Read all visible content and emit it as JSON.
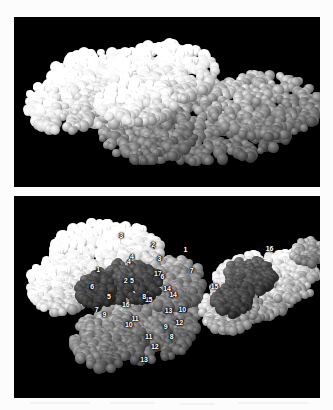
{
  "figure": {
    "background_color": "#fcfcfc",
    "panel_background": "#000000",
    "label_color": "#ffffff",
    "panels": [
      {
        "id": "top",
        "name": "dimer-overview",
        "description": "Side view of the assembled dimer, white subunit at upper left and gray subunit at lower right",
        "labels": []
      },
      {
        "id": "bottom",
        "name": "monomer-pair",
        "description": "Two separated subunit views with numbered contact residues",
        "labels": []
      }
    ]
  },
  "left_molecule": {
    "name": "left-subunit",
    "shading": "light",
    "label_count": 17,
    "labels": [
      {
        "text": "1",
        "x": 27.5,
        "y": 36.0
      },
      {
        "text": "2",
        "x": 36.5,
        "y": 41.5
      },
      {
        "text": "3",
        "x": 47.5,
        "y": 30.5
      },
      {
        "text": "4",
        "x": 38.5,
        "y": 29.5
      },
      {
        "text": "5",
        "x": 31.0,
        "y": 49.5
      },
      {
        "text": "6",
        "x": 25.5,
        "y": 44.5
      },
      {
        "text": "7",
        "x": 27.0,
        "y": 56.0
      },
      {
        "text": "8",
        "x": 51.5,
        "y": 69.5
      },
      {
        "text": "9",
        "x": 49.5,
        "y": 64.5
      },
      {
        "text": "10",
        "x": 55.0,
        "y": 56.0
      },
      {
        "text": "11",
        "x": 39.5,
        "y": 60.5
      },
      {
        "text": "12",
        "x": 46.0,
        "y": 74.0
      },
      {
        "text": "13",
        "x": 42.5,
        "y": 80.5
      },
      {
        "text": "14",
        "x": 50.0,
        "y": 45.5
      },
      {
        "text": "15",
        "x": 44.0,
        "y": 51.0
      },
      {
        "text": "16",
        "x": 36.5,
        "y": 53.5
      },
      {
        "text": "17",
        "x": 47.0,
        "y": 38.0
      }
    ]
  },
  "right_molecule": {
    "name": "right-subunit",
    "shading": "light",
    "label_count": 16,
    "labels": [
      {
        "text": "1",
        "x": 56.0,
        "y": 26.0
      },
      {
        "text": "2",
        "x": 45.5,
        "y": 23.5
      },
      {
        "text": "3",
        "x": 35.0,
        "y": 19.5
      },
      {
        "text": "4",
        "x": 37.5,
        "y": 32.0
      },
      {
        "text": "5",
        "x": 38.5,
        "y": 41.5
      },
      {
        "text": "6",
        "x": 48.5,
        "y": 39.5
      },
      {
        "text": "7",
        "x": 58.0,
        "y": 36.5
      },
      {
        "text": "8",
        "x": 42.5,
        "y": 49.5
      },
      {
        "text": "9",
        "x": 29.5,
        "y": 58.5
      },
      {
        "text": "10",
        "x": 37.5,
        "y": 63.5
      },
      {
        "text": "11",
        "x": 44.0,
        "y": 69.5
      },
      {
        "text": "12",
        "x": 54.0,
        "y": 62.5
      },
      {
        "text": "13",
        "x": 50.5,
        "y": 56.5
      },
      {
        "text": "14",
        "x": 52.0,
        "y": 48.5
      },
      {
        "text": "15",
        "x": 65.5,
        "y": 44.5
      },
      {
        "text": "16",
        "x": 83.5,
        "y": 25.5
      }
    ]
  }
}
